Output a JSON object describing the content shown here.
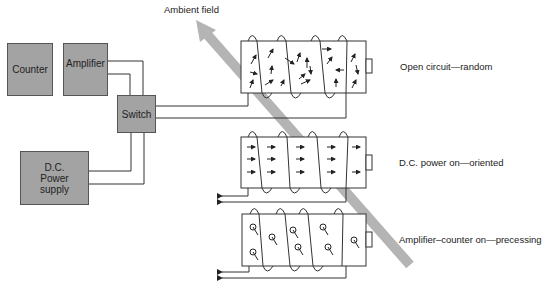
{
  "title_label": "Ambient field",
  "blocks": {
    "counter": "Counter",
    "amplifier": "Amplifier",
    "switch": "Switch",
    "power_line1": "D.C.",
    "power_line2": "Power",
    "power_line3": "supply"
  },
  "states": [
    {
      "label": "Open circuit—random"
    },
    {
      "label": "D.C. power on—oriented"
    },
    {
      "label": "Amplifier–counter on—precessing"
    }
  ],
  "colors": {
    "block_fill": "#a3a3a3",
    "field_arrow": "#b4b4b4",
    "line": "#333333"
  }
}
